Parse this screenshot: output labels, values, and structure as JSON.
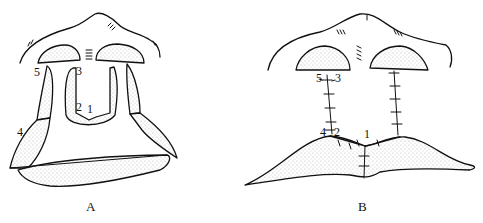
{
  "figure": {
    "panels": [
      {
        "id": "A",
        "caption": "A",
        "labels": [
          "1",
          "2",
          "3",
          "4",
          "5"
        ]
      },
      {
        "id": "B",
        "caption": "B",
        "labels": [
          "1",
          "2",
          "3",
          "4",
          "5"
        ]
      }
    ]
  }
}
